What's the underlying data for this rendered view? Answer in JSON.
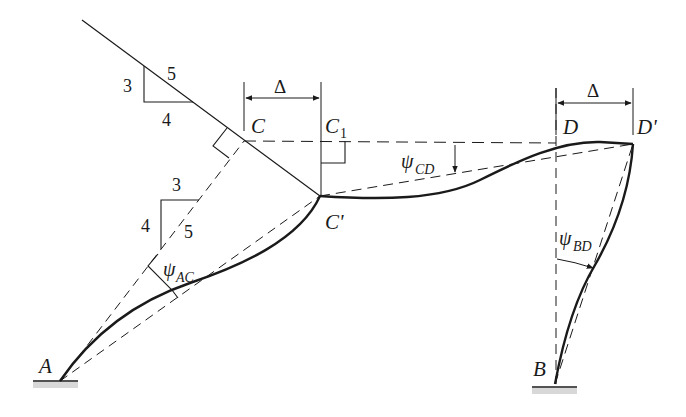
{
  "diagram": {
    "colors": {
      "line": "#1a1a1a",
      "background": "#ffffff"
    },
    "points": {
      "A": "A",
      "B": "B",
      "C": "C",
      "C1": "C",
      "C1_sub": "1",
      "C_prime": "C'",
      "D": "D",
      "D_prime": "D'"
    },
    "displacement": {
      "label": "Δ"
    },
    "slope_upper": {
      "rise": "3",
      "run": "4",
      "hyp": "5"
    },
    "slope_lower": {
      "top": "3",
      "side": "4",
      "hyp": "5"
    },
    "rotations": {
      "psi_AC": {
        "symbol": "ψ",
        "sub": "AC"
      },
      "psi_CD": {
        "symbol": "ψ",
        "sub": "CD"
      },
      "psi_BD": {
        "symbol": "ψ",
        "sub": "BD"
      }
    }
  }
}
